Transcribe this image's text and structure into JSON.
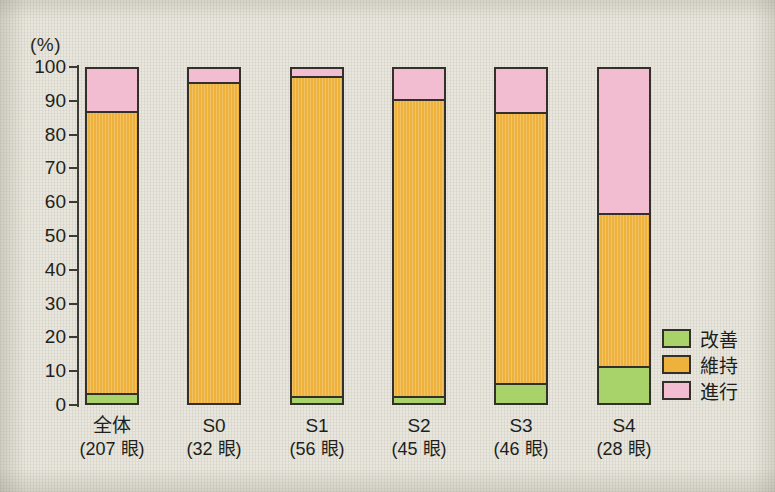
{
  "chart_data": {
    "type": "bar",
    "subtype": "stacked-percentage",
    "title": "",
    "xlabel": "",
    "ylabel": "(%)",
    "ylim": [
      0,
      100
    ],
    "yticks": [
      0,
      10,
      20,
      30,
      40,
      50,
      60,
      70,
      80,
      90,
      100
    ],
    "grid": false,
    "legend_position": "right-bottom",
    "categories": [
      "全体",
      "S0",
      "S1",
      "S2",
      "S3",
      "S4"
    ],
    "category_counts": [
      "(207 眼)",
      "(32 眼)",
      "(56 眼)",
      "(45 眼)",
      "(46 眼)",
      "(28 眼)"
    ],
    "series": [
      {
        "name": "改善",
        "color": "#a8d26a",
        "values": [
          3,
          0,
          2,
          2,
          6,
          11
        ]
      },
      {
        "name": "維持",
        "color": "#eeb23c",
        "values": [
          84.5,
          96,
          96,
          89,
          81,
          46
        ]
      },
      {
        "name": "進行",
        "color": "#f2bdd0",
        "values": [
          12.5,
          4,
          2,
          9,
          13,
          43
        ]
      }
    ]
  },
  "axis": {
    "unit_label": "(%)",
    "tick_labels": [
      "100",
      "90",
      "80",
      "70",
      "60",
      "50",
      "40",
      "30",
      "20",
      "10",
      "0"
    ]
  },
  "legend": {
    "items": [
      {
        "label": "改善",
        "color": "#a8d26a"
      },
      {
        "label": "維持",
        "color": "#eeb23c"
      },
      {
        "label": "進行",
        "color": "#f2bdd0"
      }
    ]
  },
  "colors": {
    "improve": "#a8d26a",
    "maintain": "#eeb23c",
    "progress": "#f2bdd0",
    "outline": "#332f2b",
    "background": "#e9e7dd"
  }
}
